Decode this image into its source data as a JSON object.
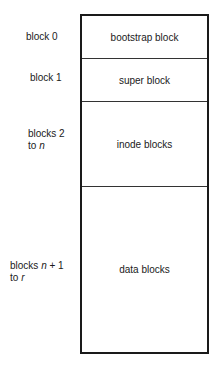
{
  "diagram": {
    "type": "disk-layout",
    "sections": [
      {
        "id": "bootstrap",
        "label": "bootstrap block",
        "range_label_parts": [
          "block 0"
        ]
      },
      {
        "id": "super",
        "label": "super block",
        "range_label_parts": [
          "block 1"
        ]
      },
      {
        "id": "inode",
        "label": "inode blocks",
        "range_label_line1": "blocks 2",
        "range_label_line2_pre": "to ",
        "range_label_line2_var": "n"
      },
      {
        "id": "data",
        "label": "data blocks",
        "range_label_line1_pre": "blocks ",
        "range_label_line1_var": "n",
        "range_label_line1_post": " + 1",
        "range_label_line2_pre": "to ",
        "range_label_line2_var": "r"
      }
    ]
  }
}
